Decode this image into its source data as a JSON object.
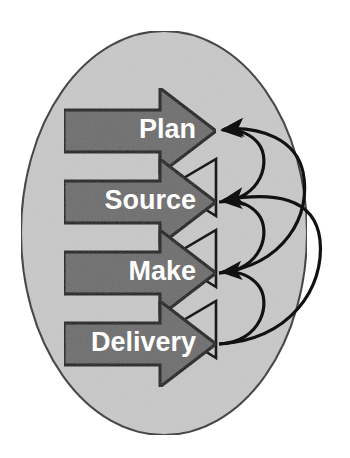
{
  "diagram": {
    "shape": "vertical chevron stack inside ellipse with feedback arcs",
    "container": {
      "name": "ellipse",
      "fill_color": "#c8c8c8",
      "stroke_color": "#3a3a3a",
      "center_x": 164,
      "center_y": 233,
      "radius_x": 143,
      "radius_y": 202
    },
    "colors": {
      "background": "#ffffff",
      "ellipse_fill": "#c8c8c8",
      "arrow_fill": "#6e6e6e",
      "arrow_stroke": "#1a1a1a",
      "notch_fill": "#c8c8c8",
      "label_text": "#ffffff",
      "feedback_arc": "#111111"
    },
    "processes": [
      {
        "label": "Plan",
        "order": 1,
        "bar_top": 110,
        "bar_bottom": 152,
        "head_top": 88,
        "head_bottom": 174,
        "tip_x": 216,
        "bar_left": 64,
        "bar_right": 160,
        "label_x": 196,
        "label_y": 131
      },
      {
        "label": "Source",
        "order": 2,
        "bar_top": 181,
        "bar_bottom": 223,
        "head_top": 159,
        "head_bottom": 245,
        "tip_x": 216,
        "bar_left": 64,
        "bar_right": 160,
        "label_x": 196,
        "label_y": 202
      },
      {
        "label": "Make",
        "order": 3,
        "bar_top": 252,
        "bar_bottom": 294,
        "head_top": 230,
        "head_bottom": 316,
        "tip_x": 216,
        "bar_left": 64,
        "bar_right": 160,
        "label_x": 196,
        "label_y": 273
      },
      {
        "label": "Delivery",
        "order": 4,
        "bar_top": 323,
        "bar_bottom": 365,
        "head_top": 301,
        "head_bottom": 387,
        "tip_x": 216,
        "bar_left": 64,
        "bar_right": 160,
        "label_x": 196,
        "label_y": 344
      }
    ],
    "feedback_arcs": [
      {
        "name": "source-to-plan",
        "from": "Source",
        "to": "Plan",
        "kind": "short"
      },
      {
        "name": "make-to-source",
        "from": "Make",
        "to": "Source",
        "kind": "short"
      },
      {
        "name": "delivery-to-make",
        "from": "Delivery",
        "to": "Make",
        "kind": "short"
      },
      {
        "name": "make-to-plan",
        "from": "Make",
        "to": "Plan",
        "kind": "long"
      },
      {
        "name": "delivery-to-source",
        "from": "Delivery",
        "to": "Source",
        "kind": "long"
      }
    ]
  }
}
